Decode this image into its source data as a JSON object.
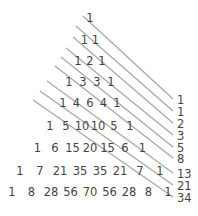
{
  "diagram": {
    "triangle_rows": [
      [
        "1"
      ],
      [
        "1",
        "1"
      ],
      [
        "1",
        "2",
        "1"
      ],
      [
        "1",
        "3",
        "3",
        "1"
      ],
      [
        "1",
        "4",
        "6",
        "4",
        "1"
      ],
      [
        "1",
        "5",
        "10",
        "10",
        "5",
        "1"
      ],
      [
        "1",
        "6",
        "15",
        "20",
        "15",
        "6",
        "1"
      ],
      [
        "1",
        "7",
        "21",
        "35",
        "35",
        "21",
        "7",
        "1"
      ],
      [
        "1",
        "8",
        "28",
        "56",
        "70",
        "56",
        "28",
        "8",
        "1"
      ]
    ],
    "diagonal_sums": [
      "1",
      "1",
      "2",
      "3",
      "5",
      "8",
      "13",
      "21",
      "34"
    ],
    "colors": {
      "text": "#444444",
      "lines": "#a8a8a8",
      "background": "#ffffff"
    }
  }
}
